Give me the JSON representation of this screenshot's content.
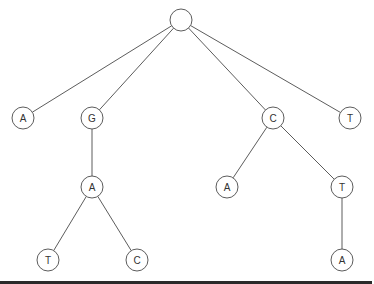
{
  "diagram": {
    "type": "tree",
    "node_radius": 11,
    "colors": {
      "stroke": "#4a4a4a",
      "label": "#333333",
      "background": "#ffffff",
      "bottom_rule": "#2a2a2a"
    },
    "nodes": [
      {
        "id": "root",
        "label": "",
        "x": 181,
        "y": 20
      },
      {
        "id": "n1",
        "label": "A",
        "x": 23,
        "y": 118
      },
      {
        "id": "n2",
        "label": "G",
        "x": 92,
        "y": 118
      },
      {
        "id": "n3",
        "label": "C",
        "x": 273,
        "y": 118
      },
      {
        "id": "n4",
        "label": "T",
        "x": 350,
        "y": 118
      },
      {
        "id": "n5",
        "label": "A",
        "x": 92,
        "y": 187
      },
      {
        "id": "n6",
        "label": "A",
        "x": 227,
        "y": 187
      },
      {
        "id": "n7",
        "label": "T",
        "x": 342,
        "y": 187
      },
      {
        "id": "n8",
        "label": "T",
        "x": 48,
        "y": 260
      },
      {
        "id": "n9",
        "label": "C",
        "x": 137,
        "y": 260
      },
      {
        "id": "n10",
        "label": "A",
        "x": 342,
        "y": 260
      }
    ],
    "edges": [
      {
        "from": "root",
        "to": "n1"
      },
      {
        "from": "root",
        "to": "n2"
      },
      {
        "from": "root",
        "to": "n3"
      },
      {
        "from": "root",
        "to": "n4"
      },
      {
        "from": "n2",
        "to": "n5"
      },
      {
        "from": "n3",
        "to": "n6"
      },
      {
        "from": "n3",
        "to": "n7"
      },
      {
        "from": "n5",
        "to": "n8"
      },
      {
        "from": "n5",
        "to": "n9"
      },
      {
        "from": "n7",
        "to": "n10"
      }
    ]
  }
}
